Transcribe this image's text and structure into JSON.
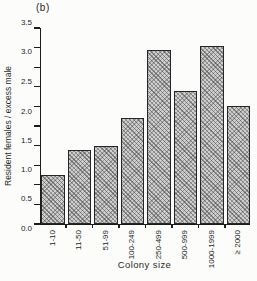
{
  "figure": {
    "panel_label": "(b)"
  },
  "chart_data": {
    "type": "bar",
    "title": "",
    "xlabel": "Colony size",
    "ylabel": "Resident females / excess male",
    "categories": [
      "1-10",
      "11-50",
      "51-99",
      "100-249",
      "250-499",
      "500-999",
      "1000-1999",
      "≥ 2000"
    ],
    "values": [
      1.25,
      1.9,
      2.0,
      2.7,
      4.45,
      3.4,
      4.55,
      3.0
    ],
    "ylim": [
      0.0,
      5.0
    ],
    "ytick_step": 0.5,
    "yticks": [
      "0.0",
      "0.5",
      "1.0",
      "1.5",
      "2.0",
      "2.5",
      "3.0",
      "3.5",
      "4.0",
      "4.5",
      "5.0"
    ],
    "grid": "off",
    "legend": "none",
    "bar_fill_color": "#cfcfcf",
    "bar_hatch": "diagonal-crosshatch",
    "bar_border_color": "#262626",
    "axis_color": "#1c1c1c",
    "background_color": "#fcfcfb"
  }
}
